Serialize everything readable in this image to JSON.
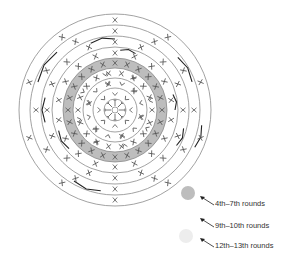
{
  "diagram": {
    "type": "crochet-round-chart",
    "center": [
      115,
      110
    ],
    "colors": {
      "line": "#8a8a8a",
      "stitch": "#555555",
      "dark": "#222222",
      "band_dark": "#bdbdbd",
      "band_light": "#ededed"
    },
    "rings": [
      {
        "r": 96
      },
      {
        "r": 85
      },
      {
        "r": 74
      },
      {
        "r": 63
      },
      {
        "r": 52
      },
      {
        "r": 42
      },
      {
        "r": 32
      },
      {
        "r": 22
      },
      {
        "r": 11
      },
      {
        "r": 3
      }
    ],
    "bands": [
      {
        "name": "4th-7th rounds shading",
        "outer": 52,
        "inner": 42,
        "fill": "#bdbdbd"
      }
    ],
    "stitch_rounds": [
      {
        "symbol": "x",
        "r": 90,
        "count": 10,
        "offset": -90
      },
      {
        "symbol": "x",
        "r": 79,
        "count": 12,
        "offset": -90
      },
      {
        "symbol": "x",
        "r": 68,
        "count": 16,
        "offset": -90
      },
      {
        "symbol": "x",
        "r": 57,
        "count": 18,
        "offset": -90
      },
      {
        "symbol": "x",
        "r": 47,
        "count": 24,
        "offset": -90
      },
      {
        "symbol": "x",
        "r": 37,
        "count": 18,
        "offset": -80
      },
      {
        "symbol": "v",
        "r": 37,
        "count": 8,
        "offset": -60
      },
      {
        "symbol": "v",
        "r": 27,
        "count": 12,
        "offset": -75
      },
      {
        "symbol": "x",
        "r": 27,
        "count": 6,
        "offset": -45
      },
      {
        "symbol": "v",
        "r": 16,
        "count": 8,
        "offset": -90
      },
      {
        "symbol": "spoke",
        "r": 7,
        "count": 8,
        "offset": -90
      }
    ],
    "dark_brackets": [
      {
        "r": 82,
        "start": 200,
        "end": 225
      },
      {
        "r": 82,
        "start": 320,
        "end": 340
      },
      {
        "r": 82,
        "start": 100,
        "end": 120
      },
      {
        "r": 71,
        "start": 170,
        "end": 190
      },
      {
        "r": 71,
        "start": 250,
        "end": 270
      },
      {
        "r": 71,
        "start": 15,
        "end": 30
      },
      {
        "r": 60,
        "start": 140,
        "end": 160
      },
      {
        "r": 60,
        "start": 275,
        "end": 290
      },
      {
        "r": 60,
        "start": 345,
        "end": 360
      },
      {
        "r": 88,
        "start": 10,
        "end": 25
      }
    ]
  },
  "legend": {
    "items": [
      {
        "swatch": "#bdbdbd",
        "cx": 188,
        "cy": 193,
        "label": "4th–7th rounds",
        "lx": 215,
        "ly": 203,
        "ax1": 214,
        "ay1": 205,
        "ax2": 200,
        "ay2": 196
      },
      {
        "swatch": "#ffffff",
        "cx": 188,
        "cy": 214,
        "label": "9th–10th rounds",
        "lx": 215,
        "ly": 225,
        "ax1": 214,
        "ay1": 227,
        "ax2": 200,
        "ay2": 218
      },
      {
        "swatch": "#ededed",
        "cx": 186,
        "cy": 236,
        "label": "12th–13th rounds",
        "lx": 215,
        "ly": 245,
        "ax1": 214,
        "ay1": 247,
        "ax2": 200,
        "ay2": 238
      }
    ]
  }
}
